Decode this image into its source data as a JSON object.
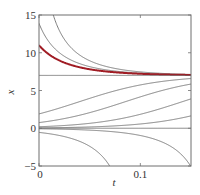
{
  "chart_data": {
    "type": "line",
    "title": "",
    "xlabel": "t",
    "ylabel": "x",
    "xlim": [
      0,
      0.15
    ],
    "ylim": [
      -5,
      15
    ],
    "x_ticks": [
      {
        "value": 0,
        "label": "0"
      },
      {
        "value": 0.1,
        "label": "0.1"
      }
    ],
    "y_ticks": [
      {
        "value": -5,
        "label": "−5"
      },
      {
        "value": 0,
        "label": "0"
      },
      {
        "value": 5,
        "label": "5"
      },
      {
        "value": 10,
        "label": "10"
      },
      {
        "value": 15,
        "label": "15"
      }
    ],
    "grid": false,
    "model": "logistic: dx/dt = r x (1 - x/K)",
    "r": 25,
    "K": 7,
    "equilibria": [
      0,
      7
    ],
    "series": [
      {
        "name": "blowup-upper-1",
        "x0": 29,
        "color": "#6e6e6e",
        "highlight": false
      },
      {
        "name": "blowup-upper-2",
        "x0": 13.9,
        "color": "#6e6e6e",
        "highlight": false
      },
      {
        "name": "highlighted-solution",
        "x0": 11,
        "color": "#a01c24",
        "highlight": true
      },
      {
        "name": "equilibrium-K",
        "x0": 7,
        "color": "#6e6e6e",
        "highlight": false
      },
      {
        "name": "rising-1",
        "x0": 1.9,
        "color": "#6e6e6e",
        "highlight": false
      },
      {
        "name": "rising-2",
        "x0": 0.75,
        "color": "#6e6e6e",
        "highlight": false
      },
      {
        "name": "rising-3",
        "x0": 0.2,
        "color": "#6e6e6e",
        "highlight": false
      },
      {
        "name": "rising-4",
        "x0": 0.05,
        "color": "#6e6e6e",
        "highlight": false
      },
      {
        "name": "equilibrium-zero",
        "x0": 0,
        "color": "#6e6e6e",
        "highlight": false
      },
      {
        "name": "falling-1",
        "x0": -0.07,
        "color": "#6e6e6e",
        "highlight": false
      },
      {
        "name": "falling-2",
        "x0": -0.55,
        "color": "#6e6e6e",
        "highlight": false
      }
    ]
  }
}
